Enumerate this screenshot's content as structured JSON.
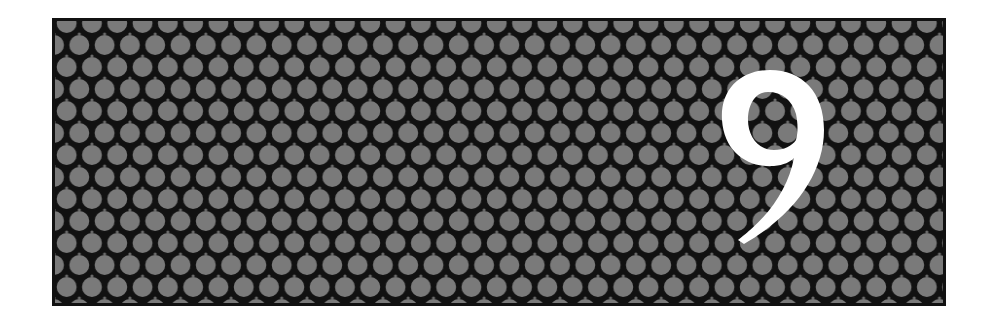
{
  "banner": {
    "chapter_number": "9",
    "pattern": "hexagonal-circle-grid",
    "colors": {
      "background": "#ffffff",
      "pattern_line": "#111111",
      "circle_fill": "#7a7a7a",
      "numeral": "#ffffff"
    },
    "grid": {
      "circle_diameter_px": 22,
      "column_pitch_px": 25.3,
      "row_pitch_px": 22
    }
  }
}
